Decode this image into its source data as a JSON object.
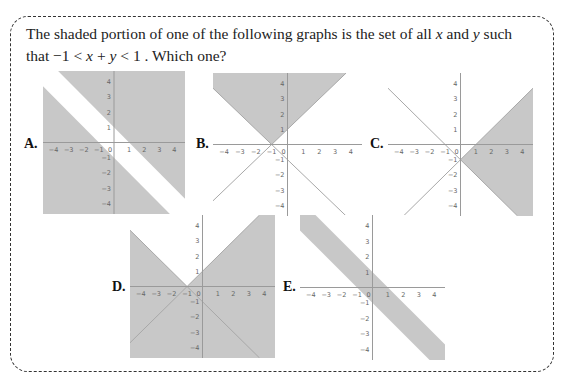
{
  "question": {
    "line1_pre": "The shaded portion of one of the following graphs is the set of all ",
    "var_x": "x",
    "line1_mid": " and ",
    "var_y": "y",
    "line1_post": " such",
    "line2_pre": "that  −1 < ",
    "line2_expr_x": "x",
    "line2_plus": " + ",
    "line2_expr_y": "y",
    "line2_post": " < 1 . Which one?"
  },
  "colors": {
    "shade": "#c8c8c8",
    "axis": "#9a9a9a",
    "line": "#a8a8a8",
    "tick_text": "#666666",
    "border": "#333333"
  },
  "axis_ticks": {
    "x": [
      "-4",
      "-3",
      "-2",
      "-1",
      "0",
      "1",
      "2",
      "3",
      "4"
    ],
    "y": [
      "4",
      "3",
      "2",
      "1",
      "-1",
      "-2",
      "-3",
      "-4"
    ]
  },
  "options": [
    {
      "label": "A.",
      "description": "Shaded outside the strip -1 < x+y < 1"
    },
    {
      "label": "B.",
      "description": "Shaded region above both lines y = x+1 and y = -x-1"
    },
    {
      "label": "C.",
      "description": "Shaded region right of both lines y = x-1 and y = -x-1"
    },
    {
      "label": "D.",
      "description": "Shaded everywhere except region above both lines"
    },
    {
      "label": "E.",
      "description": "Shaded strip between x+y = -1 and x+y = 1"
    }
  ],
  "chart_data": [
    {
      "type": "region",
      "label": "A",
      "xlim": [
        -4.7,
        4.7
      ],
      "ylim": [
        -4.7,
        4.7
      ],
      "shaded": "x+y<=-1 or x+y>=1"
    },
    {
      "type": "region",
      "label": "B",
      "xlim": [
        -4.7,
        4.7
      ],
      "ylim": [
        -4.7,
        4.7
      ],
      "shaded": "y>=x+1 and y>=-x-1",
      "lines": [
        "y=x+1",
        "y=-x-1"
      ]
    },
    {
      "type": "region",
      "label": "C",
      "xlim": [
        -4.7,
        4.7
      ],
      "ylim": [
        -4.7,
        4.7
      ],
      "shaded": "y<=x-1 and y>=-x-1 (x>=0)",
      "lines": [
        "y=x-1",
        "y=-x-1"
      ]
    },
    {
      "type": "region",
      "label": "D",
      "xlim": [
        -4.7,
        4.7
      ],
      "ylim": [
        -4.7,
        4.7
      ],
      "shaded": "not (y>=x+1 and y>=-x-1)",
      "lines": [
        "y=x+1",
        "y=-x-1"
      ]
    },
    {
      "type": "region",
      "label": "E",
      "xlim": [
        -4.7,
        4.7
      ],
      "ylim": [
        -4.7,
        4.7
      ],
      "shaded": "-1<x+y<1"
    }
  ]
}
